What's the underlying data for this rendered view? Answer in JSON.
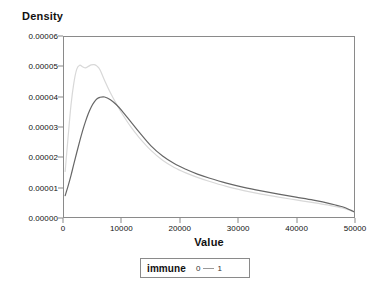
{
  "chart_data": {
    "type": "line",
    "title": "",
    "xlabel": "Value",
    "ylabel": "Density",
    "xlim": [
      0,
      50000
    ],
    "ylim": [
      0,
      6e-05
    ],
    "grid": false,
    "legend_position": "bottom",
    "legend_title": "immune",
    "x_ticks": [
      "0",
      "10000",
      "20000",
      "30000",
      "40000",
      "50000"
    ],
    "x_tick_values": [
      0,
      10000,
      20000,
      30000,
      40000,
      50000
    ],
    "y_ticks": [
      "0.00000",
      "0.00001",
      "0.00002",
      "0.00003",
      "0.00004",
      "0.00005",
      "0.00006"
    ],
    "y_tick_values": [
      0.0,
      1e-05,
      2e-05,
      3e-05,
      4e-05,
      5e-05,
      6e-05
    ],
    "series": [
      {
        "name": "0",
        "color": "#d8d8d8",
        "x": [
          200,
          700,
          1200,
          1700,
          2200,
          2700,
          3200,
          3700,
          4200,
          4700,
          5200,
          5700,
          6200,
          7000,
          8000,
          9000,
          10000,
          11500,
          13000,
          15000,
          17000,
          19000,
          21000,
          23000,
          25000,
          28000,
          31000,
          34000,
          37000,
          40000,
          43000,
          46000,
          48000,
          49500,
          50000
        ],
        "y": [
          1.52e-05,
          2.65e-05,
          3.72e-05,
          4.47e-05,
          4.93e-05,
          5.06e-05,
          5.01e-05,
          4.97e-05,
          5.02e-05,
          5.07e-05,
          5.08e-05,
          5.03e-05,
          4.91e-05,
          4.55e-05,
          4.14e-05,
          3.78e-05,
          3.45e-05,
          3.01e-05,
          2.64e-05,
          2.22e-05,
          1.89e-05,
          1.65e-05,
          1.47e-05,
          1.32e-05,
          1.19e-05,
          1.02e-05,
          8.8e-06,
          7.6e-06,
          6.6e-06,
          5.7e-06,
          4.8e-06,
          3.8e-06,
          3e-06,
          2.1e-06,
          1.7e-06
        ]
      },
      {
        "name": "1",
        "color": "#666666",
        "x": [
          200,
          700,
          1200,
          1700,
          2200,
          2700,
          3200,
          3700,
          4200,
          4700,
          5200,
          5700,
          6200,
          7000,
          8000,
          9000,
          10000,
          11500,
          13000,
          15000,
          17000,
          19000,
          21000,
          23000,
          25000,
          28000,
          31000,
          34000,
          37000,
          40000,
          43000,
          46000,
          48000,
          49500,
          50000
        ],
        "y": [
          7.1e-06,
          1.03e-05,
          1.38e-05,
          1.77e-05,
          2.15e-05,
          2.52e-05,
          2.87e-05,
          3.18e-05,
          3.45e-05,
          3.67e-05,
          3.83e-05,
          3.94e-05,
          3.99e-05,
          4e-05,
          3.91e-05,
          3.75e-05,
          3.54e-05,
          3.18e-05,
          2.82e-05,
          2.37e-05,
          2.03e-05,
          1.78e-05,
          1.59e-05,
          1.43e-05,
          1.3e-05,
          1.13e-05,
          9.9e-06,
          8.7e-06,
          7.6e-06,
          6.6e-06,
          5.6e-06,
          4.4e-06,
          3.4e-06,
          2.2e-06,
          1.8e-06
        ]
      }
    ]
  },
  "axis": {
    "y_title": "Density",
    "x_title": "Value"
  },
  "legend": {
    "title": "immune",
    "items": [
      {
        "label": "0",
        "color": "#d8d8d8"
      },
      {
        "label": "1",
        "color": "#666666"
      }
    ]
  }
}
